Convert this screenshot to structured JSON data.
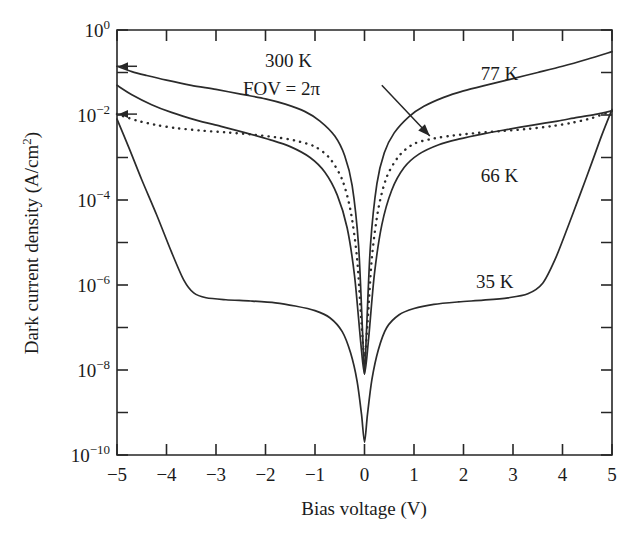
{
  "chart_data": {
    "type": "line",
    "title": "",
    "xlabel": "Bias voltage (V)",
    "ylabel": "Dark current density (A/cm2)",
    "ylabel_display": "Dark current density (A/cm",
    "ylabel_sup": "2",
    "ylabel_tail": ")",
    "xlim": [
      -5,
      5
    ],
    "ylim": [
      1e-10,
      1
    ],
    "yscale": "log",
    "xscale": "linear",
    "grid": false,
    "legend": "inline curve labels",
    "x_ticks": [
      "-5",
      "-4",
      "-3",
      "-2",
      "-1",
      "0",
      "1",
      "2",
      "3",
      "4",
      "5"
    ],
    "x_tick_values": [
      -5,
      -4,
      -3,
      -2,
      -1,
      0,
      1,
      2,
      3,
      4,
      5
    ],
    "y_ticks_major": [
      "10^0",
      "10^-2",
      "10^-4",
      "10^-6",
      "10^-8",
      "10^-10"
    ],
    "y_tick_mantissa": "10",
    "y_tick_exponents": [
      "0",
      "-2",
      "-4",
      "-6",
      "-8",
      "-10"
    ],
    "y_tick_values": [
      1,
      0.01,
      0.0001,
      1e-06,
      1e-08,
      1e-10
    ],
    "y_minor_exponents": [
      -1,
      -3,
      -5,
      -7,
      -9
    ],
    "annotations": [
      {
        "name": "condition-300k",
        "text": "300 K",
        "x": 0.0,
        "y": 0.22
      },
      {
        "name": "condition-fov",
        "text": "FOV = 2π",
        "x": 0.0,
        "y": 0.065
      },
      {
        "name": "arrow-to-300k-curve",
        "from_x": 0.35,
        "from_y": 0.05,
        "to_x": 1.32,
        "to_y": 0.0032
      }
    ],
    "series": [
      {
        "name": "77 K",
        "label": "77 K",
        "style": "solid",
        "color": "#2b2b2b",
        "label_x": 2.35,
        "label_y": 0.09,
        "points": [
          [
            -5,
            0.14
          ],
          [
            -4.7,
            0.105
          ],
          [
            -4.4,
            0.085
          ],
          [
            -4.0,
            0.066
          ],
          [
            -3.5,
            0.05
          ],
          [
            -3.0,
            0.04
          ],
          [
            -2.5,
            0.031
          ],
          [
            -2.0,
            0.024
          ],
          [
            -1.6,
            0.018
          ],
          [
            -1.2,
            0.012
          ],
          [
            -0.9,
            0.0072
          ],
          [
            -0.6,
            0.0032
          ],
          [
            -0.4,
            0.0011
          ],
          [
            -0.25,
            0.00022
          ],
          [
            -0.12,
            8.5e-06
          ],
          [
            -0.04,
            8e-08
          ],
          [
            0,
            8e-09
          ],
          [
            0.04,
            8e-08
          ],
          [
            0.12,
            8.5e-06
          ],
          [
            0.25,
            0.00024
          ],
          [
            0.4,
            0.0013
          ],
          [
            0.6,
            0.0038
          ],
          [
            0.9,
            0.0092
          ],
          [
            1.2,
            0.016
          ],
          [
            1.6,
            0.026
          ],
          [
            2.0,
            0.037
          ],
          [
            2.5,
            0.052
          ],
          [
            3.0,
            0.072
          ],
          [
            3.5,
            0.1
          ],
          [
            4.0,
            0.14
          ],
          [
            4.5,
            0.205
          ],
          [
            5,
            0.31
          ]
        ]
      },
      {
        "name": "300 K FOV = 2pi",
        "label": "300 K",
        "style": "dotted",
        "color": "#2b2b2b",
        "label_x": null,
        "label_y": null,
        "points": [
          [
            -5,
            0.0105
          ],
          [
            -4.6,
            0.0074
          ],
          [
            -4.2,
            0.0058
          ],
          [
            -3.8,
            0.0049
          ],
          [
            -3.3,
            0.0043
          ],
          [
            -2.8,
            0.0039
          ],
          [
            -2.3,
            0.0035
          ],
          [
            -1.8,
            0.003
          ],
          [
            -1.4,
            0.0025
          ],
          [
            -1.0,
            0.0018
          ],
          [
            -0.7,
            0.00095
          ],
          [
            -0.45,
            0.0003
          ],
          [
            -0.28,
            5.5e-05
          ],
          [
            -0.15,
            4.2e-06
          ],
          [
            -0.06,
            1.2e-07
          ],
          [
            0,
            2e-08
          ],
          [
            0.06,
            1.2e-07
          ],
          [
            0.15,
            4.5e-06
          ],
          [
            0.28,
            6.2e-05
          ],
          [
            0.45,
            0.00035
          ],
          [
            0.7,
            0.0011
          ],
          [
            1.0,
            0.0021
          ],
          [
            1.4,
            0.0028
          ],
          [
            1.8,
            0.0033
          ],
          [
            2.3,
            0.0038
          ],
          [
            2.8,
            0.0042
          ],
          [
            3.3,
            0.0047
          ],
          [
            3.8,
            0.0055
          ],
          [
            4.2,
            0.0066
          ],
          [
            4.6,
            0.0085
          ],
          [
            5,
            0.0125
          ]
        ]
      },
      {
        "name": "66 K",
        "label": "66 K",
        "style": "solid",
        "color": "#2b2b2b",
        "label_x": 2.35,
        "label_y": 0.00036,
        "points": [
          [
            -5,
            0.05
          ],
          [
            -4.7,
            0.03
          ],
          [
            -4.3,
            0.0175
          ],
          [
            -3.9,
            0.0115
          ],
          [
            -3.4,
            0.0076
          ],
          [
            -2.9,
            0.0054
          ],
          [
            -2.4,
            0.0038
          ],
          [
            -1.9,
            0.0026
          ],
          [
            -1.5,
            0.0018
          ],
          [
            -1.1,
            0.001
          ],
          [
            -0.8,
            0.00045
          ],
          [
            -0.55,
            0.00013
          ],
          [
            -0.35,
            2.2e-05
          ],
          [
            -0.2,
            1.6e-06
          ],
          [
            -0.08,
            5e-08
          ],
          [
            0,
            8e-09
          ],
          [
            0.08,
            5e-08
          ],
          [
            0.2,
            1.8e-06
          ],
          [
            0.35,
            2.6e-05
          ],
          [
            0.55,
            0.00017
          ],
          [
            0.8,
            0.00058
          ],
          [
            1.1,
            0.0012
          ],
          [
            1.5,
            0.002
          ],
          [
            1.9,
            0.0027
          ],
          [
            2.4,
            0.0036
          ],
          [
            2.9,
            0.0046
          ],
          [
            3.4,
            0.0058
          ],
          [
            3.9,
            0.0072
          ],
          [
            4.3,
            0.0088
          ],
          [
            4.7,
            0.0105
          ],
          [
            5,
            0.0125
          ]
        ]
      },
      {
        "name": "35 K",
        "label": "35 K",
        "style": "solid",
        "color": "#2b2b2b",
        "label_x": 2.25,
        "label_y": 1.2e-06,
        "points": [
          [
            -5,
            0.008
          ],
          [
            -4.75,
            0.0016
          ],
          [
            -4.5,
            0.0003
          ],
          [
            -4.2,
            4.5e-05
          ],
          [
            -3.9,
            6e-06
          ],
          [
            -3.65,
            1.3e-06
          ],
          [
            -3.45,
            6.5e-07
          ],
          [
            -3.2,
            5e-07
          ],
          [
            -2.8,
            4.5e-07
          ],
          [
            -2.3,
            4.2e-07
          ],
          [
            -1.8,
            3.8e-07
          ],
          [
            -1.4,
            3.2e-07
          ],
          [
            -1.0,
            2.5e-07
          ],
          [
            -0.7,
            1.7e-07
          ],
          [
            -0.45,
            8e-08
          ],
          [
            -0.28,
            2.5e-08
          ],
          [
            -0.15,
            5.5e-09
          ],
          [
            -0.06,
            9e-10
          ],
          [
            0,
            2e-10
          ],
          [
            0.06,
            9e-10
          ],
          [
            0.15,
            6e-09
          ],
          [
            0.28,
            3e-08
          ],
          [
            0.45,
            1e-07
          ],
          [
            0.7,
            2e-07
          ],
          [
            1.0,
            2.8e-07
          ],
          [
            1.4,
            3.5e-07
          ],
          [
            1.9,
            4e-07
          ],
          [
            2.4,
            4.4e-07
          ],
          [
            2.9,
            5e-07
          ],
          [
            3.3,
            6.2e-07
          ],
          [
            3.6,
            1.1e-06
          ],
          [
            3.85,
            4e-06
          ],
          [
            4.1,
            2.2e-05
          ],
          [
            4.35,
            0.00013
          ],
          [
            4.6,
            0.0008
          ],
          [
            4.8,
            0.0035
          ],
          [
            5,
            0.0135
          ]
        ]
      }
    ]
  },
  "axis_arrow_markers": [
    {
      "name": "left-edge-marker-77k",
      "y": 0.14
    },
    {
      "name": "left-edge-marker-300k",
      "y": 0.0105
    }
  ]
}
